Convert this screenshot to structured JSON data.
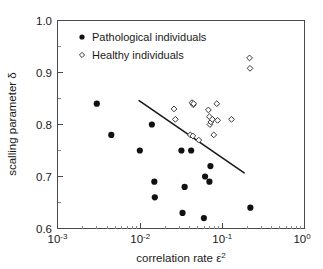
{
  "chart_data": {
    "type": "scatter",
    "title": "",
    "xlabel": "correlation rate ε²",
    "ylabel": "scalling parameter δ",
    "xscale": "log",
    "yscale": "linear",
    "xlim": [
      0.001,
      1
    ],
    "ylim": [
      0.6,
      1.0
    ],
    "xticks": [
      "10⁻³",
      "10⁻²",
      "10⁻¹",
      "10⁰"
    ],
    "xtick_values": [
      0.001,
      0.01,
      0.1,
      1
    ],
    "yticks": [
      "0.6",
      "0.7",
      "0.8",
      "0.9",
      "1.0"
    ],
    "ytick_values": [
      0.6,
      0.7,
      0.8,
      0.9,
      1.0
    ],
    "grid": false,
    "legend_position": "top-left-inside",
    "series": [
      {
        "name": "Pathological individuals",
        "marker": "filled-circle",
        "color": "#111111",
        "points": [
          {
            "x": 0.003,
            "y": 0.84
          },
          {
            "x": 0.0045,
            "y": 0.78
          },
          {
            "x": 0.01,
            "y": 0.75
          },
          {
            "x": 0.014,
            "y": 0.8
          },
          {
            "x": 0.015,
            "y": 0.69
          },
          {
            "x": 0.0152,
            "y": 0.66
          },
          {
            "x": 0.032,
            "y": 0.75
          },
          {
            "x": 0.033,
            "y": 0.63
          },
          {
            "x": 0.035,
            "y": 0.68
          },
          {
            "x": 0.042,
            "y": 0.75
          },
          {
            "x": 0.06,
            "y": 0.62
          },
          {
            "x": 0.062,
            "y": 0.7
          },
          {
            "x": 0.07,
            "y": 0.69
          },
          {
            "x": 0.072,
            "y": 0.72
          },
          {
            "x": 0.22,
            "y": 0.64
          }
        ]
      },
      {
        "name": "Healthy individuals",
        "marker": "open-diamond",
        "color": "#3a3a3a",
        "points": [
          {
            "x": 0.026,
            "y": 0.83
          },
          {
            "x": 0.027,
            "y": 0.81
          },
          {
            "x": 0.043,
            "y": 0.842
          },
          {
            "x": 0.0445,
            "y": 0.838
          },
          {
            "x": 0.045,
            "y": 0.84
          },
          {
            "x": 0.041,
            "y": 0.78
          },
          {
            "x": 0.044,
            "y": 0.778
          },
          {
            "x": 0.052,
            "y": 0.77
          },
          {
            "x": 0.068,
            "y": 0.828
          },
          {
            "x": 0.07,
            "y": 0.815
          },
          {
            "x": 0.071,
            "y": 0.8
          },
          {
            "x": 0.073,
            "y": 0.805
          },
          {
            "x": 0.076,
            "y": 0.81
          },
          {
            "x": 0.079,
            "y": 0.78
          },
          {
            "x": 0.086,
            "y": 0.84
          },
          {
            "x": 0.088,
            "y": 0.808
          },
          {
            "x": 0.13,
            "y": 0.81
          },
          {
            "x": 0.215,
            "y": 0.928
          },
          {
            "x": 0.218,
            "y": 0.908
          }
        ]
      }
    ],
    "trend_line": {
      "x_start": 0.0098,
      "y_start": 0.846,
      "x_end": 0.185,
      "y_end": 0.707,
      "style": "solid"
    }
  },
  "legend": {
    "entries": [
      {
        "label": "Pathological individuals",
        "marker": "filled-circle"
      },
      {
        "label": "Healthy individuals",
        "marker": "open-diamond"
      }
    ]
  },
  "axes": {
    "x_title": "correlation rate ε",
    "x_title_sup": "2",
    "y_title": "scalling parameter δ",
    "x_tick_labels": [
      {
        "base": "10",
        "exp": "-3"
      },
      {
        "base": "10",
        "exp": "-2"
      },
      {
        "base": "10",
        "exp": "-1"
      },
      {
        "base": "10",
        "exp": "0"
      }
    ],
    "y_tick_labels": [
      "1.0",
      "0.9",
      "0.8",
      "0.7",
      "0.6"
    ]
  },
  "colors": {
    "axis": "#4a4a4a",
    "pathological": "#111111",
    "healthy_stroke": "#3a3a3a",
    "trend": "#1a1a1a",
    "background": "#ffffff"
  }
}
